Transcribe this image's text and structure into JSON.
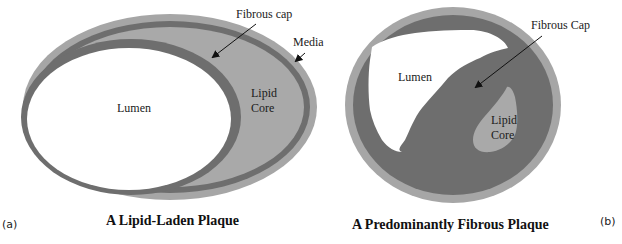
{
  "figure": {
    "colors": {
      "media": "#a6a6a6",
      "fibrous": "#6e6e6e",
      "lipid": "#a9a9a9",
      "lumen": "#ffffff",
      "text": "#1a1a1a"
    },
    "panel_a": {
      "label": "(a)",
      "title": "A Lipid-Laden Plaque",
      "labels": {
        "lumen": "Lumen",
        "lipid_line1": "Lipid",
        "lipid_line2": "Core",
        "fibrous_cap": "Fibrous cap",
        "media": "Media"
      }
    },
    "panel_b": {
      "label": "(b)",
      "title": "A Predominantly Fibrous Plaque",
      "labels": {
        "lumen": "Lumen",
        "lipid_line1": "Lipid",
        "lipid_line2": "Core",
        "fibrous_cap": "Fibrous Cap"
      }
    }
  }
}
